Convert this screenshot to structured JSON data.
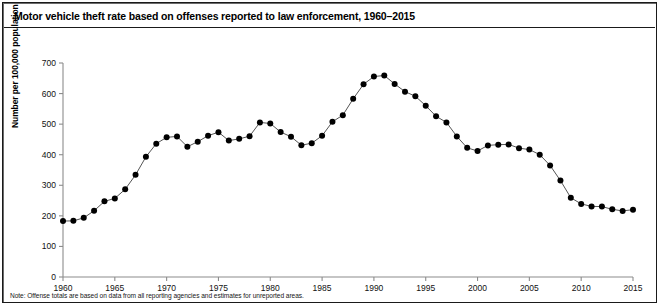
{
  "figure": {
    "title": "Motor vehicle theft rate based on offenses reported to law enforcement, 1960–2015",
    "note": "Note: Offense totals are based on data from all reporting agencies and estimates for unreported areas."
  },
  "axes": {
    "ylabel": "Number per 100,000 population",
    "yticks": [
      "0",
      "100",
      "200",
      "300",
      "400",
      "500",
      "600",
      "700"
    ],
    "xticks": [
      "1960",
      "1965",
      "1970",
      "1975",
      "1980",
      "1985",
      "1990",
      "1995",
      "2000",
      "2005",
      "2010",
      "2015"
    ]
  },
  "style": {
    "line_color": "#555555",
    "marker_color": "#000000",
    "axis_color": "#8c8c8c",
    "text_color": "#111111"
  },
  "chart_data": {
    "type": "line",
    "title": "Motor vehicle theft rate based on offenses reported to law enforcement, 1960–2015",
    "xlabel": "",
    "ylabel": "Number per 100,000 population",
    "xlim": [
      1960,
      2015
    ],
    "ylim": [
      0,
      700
    ],
    "ytick_step": 100,
    "grid": false,
    "legend": "none",
    "markers": "filled-circle",
    "x": [
      1960,
      1961,
      1962,
      1963,
      1964,
      1965,
      1966,
      1967,
      1968,
      1969,
      1970,
      1971,
      1972,
      1973,
      1974,
      1975,
      1976,
      1977,
      1978,
      1979,
      1980,
      1981,
      1982,
      1983,
      1984,
      1985,
      1986,
      1987,
      1988,
      1989,
      1990,
      1991,
      1992,
      1993,
      1994,
      1995,
      1996,
      1997,
      1998,
      1999,
      2000,
      2001,
      2002,
      2003,
      2004,
      2005,
      2006,
      2007,
      2008,
      2009,
      2010,
      2011,
      2012,
      2013,
      2014,
      2015
    ],
    "series": [
      {
        "name": "Motor vehicle theft rate",
        "values": [
          183.0,
          183.6,
          193.4,
          216.6,
          247.4,
          257.1,
          286.9,
          334.1,
          393.0,
          436.2,
          456.8,
          459.8,
          426.1,
          442.6,
          462.2,
          473.7,
          446.1,
          451.9,
          460.5,
          505.6,
          502.2,
          474.1,
          458.8,
          431.1,
          437.7,
          462.0,
          507.8,
          529.4,
          582.9,
          630.4,
          655.8,
          659.0,
          631.6,
          606.3,
          591.3,
          560.3,
          525.7,
          505.7,
          459.9,
          422.5,
          412.2,
          430.5,
          432.9,
          433.7,
          421.5,
          416.8,
          400.2,
          364.9,
          315.4,
          259.2,
          239.1,
          230.9,
          230.4,
          221.3,
          216.2,
          220.2
        ]
      }
    ]
  }
}
